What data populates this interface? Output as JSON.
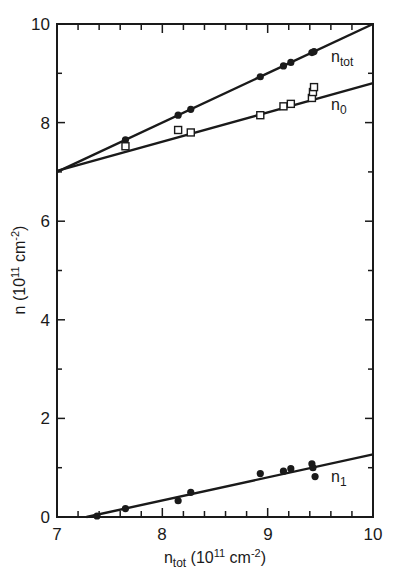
{
  "chart_data": {
    "type": "scatter",
    "title": "",
    "xlabel": "n_tot (10^11 cm^-2)",
    "ylabel": "n (10^11 cm^-2)",
    "xlim": [
      7,
      10
    ],
    "ylim": [
      0,
      10
    ],
    "x_ticks": [
      7,
      8,
      9,
      10
    ],
    "y_ticks": [
      0,
      2,
      4,
      6,
      8,
      10
    ],
    "grid": false,
    "legend_position": "inline labels at right end of each line",
    "series": [
      {
        "name": "n_tot",
        "marker": "filled-circle",
        "points": [
          [
            7.65,
            7.65
          ],
          [
            8.15,
            8.15
          ],
          [
            8.27,
            8.27
          ],
          [
            8.93,
            8.93
          ],
          [
            9.15,
            9.15
          ],
          [
            9.22,
            9.22
          ],
          [
            9.42,
            9.42
          ],
          [
            9.44,
            9.44
          ]
        ],
        "fit_line": [
          [
            7.0,
            7.0
          ],
          [
            10.0,
            10.0
          ]
        ]
      },
      {
        "name": "n_0",
        "marker": "open-square",
        "points": [
          [
            7.65,
            7.52
          ],
          [
            8.15,
            7.85
          ],
          [
            8.27,
            7.8
          ],
          [
            8.93,
            8.15
          ],
          [
            9.15,
            8.33
          ],
          [
            9.22,
            8.38
          ],
          [
            9.42,
            8.5
          ],
          [
            9.43,
            8.62
          ],
          [
            9.44,
            8.72
          ]
        ],
        "fit_line": [
          [
            7.0,
            7.02
          ],
          [
            10.0,
            8.8
          ]
        ]
      },
      {
        "name": "n_1",
        "marker": "filled-circle",
        "points": [
          [
            7.38,
            0.02
          ],
          [
            7.65,
            0.17
          ],
          [
            8.15,
            0.33
          ],
          [
            8.27,
            0.5
          ],
          [
            8.93,
            0.88
          ],
          [
            9.15,
            0.93
          ],
          [
            9.22,
            0.98
          ],
          [
            9.42,
            1.08
          ],
          [
            9.43,
            1.0
          ],
          [
            9.45,
            0.82
          ]
        ],
        "fit_line": [
          [
            7.28,
            0.0
          ],
          [
            10.0,
            1.27
          ]
        ]
      }
    ],
    "annotations": [
      {
        "text": "n_tot",
        "near": [
          9.7,
          9.35
        ]
      },
      {
        "text": "n_0",
        "near": [
          9.7,
          8.05
        ]
      },
      {
        "text": "n_1",
        "near": [
          9.7,
          0.85
        ]
      }
    ]
  },
  "labels": {
    "x_ticks": [
      "7",
      "8",
      "9",
      "10"
    ],
    "y_ticks": [
      "0",
      "2",
      "4",
      "6",
      "8",
      "10"
    ],
    "xlabel_main": "n",
    "xlabel_sub": "tot",
    "xlabel_rest": " (10",
    "xlabel_exp": "11",
    "xlabel_unit": " cm",
    "xlabel_unit_exp": "-2",
    "xlabel_close": ")",
    "ylabel_main": "n (10",
    "ylabel_exp": "11",
    "ylabel_unit": " cm",
    "ylabel_unit_exp": "-2",
    "ylabel_close": ")",
    "series_ntot_main": "n",
    "series_ntot_sub": "tot",
    "series_n0_main": "n",
    "series_n0_sub": "0",
    "series_n1_main": "n",
    "series_n1_sub": "1"
  },
  "style": {
    "ink": "#1a1a1a",
    "background": "#ffffff"
  }
}
